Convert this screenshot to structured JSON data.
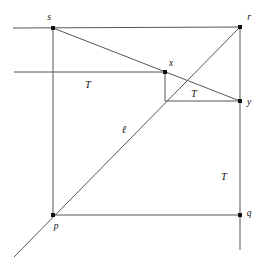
{
  "figure": {
    "background_color": "#ffffff",
    "line_color": "#555555",
    "line_color_dark": "#4a4a4a",
    "vertex_color": "#111111",
    "label_color": "#111111",
    "stroke_width": 1.0,
    "vertex_size": 4
  },
  "points": [
    {
      "id": "s",
      "label": "s",
      "x": 53,
      "y": 28,
      "label_x": 49,
      "label_y": 20
    },
    {
      "id": "r",
      "label": "r",
      "x": 240,
      "y": 27,
      "label_x": 249,
      "label_y": 20
    },
    {
      "id": "x",
      "label": "x",
      "x": 165,
      "y": 72,
      "label_x": 171,
      "label_y": 66
    },
    {
      "id": "y",
      "label": "y",
      "x": 240,
      "y": 101,
      "label_x": 249,
      "label_y": 105
    },
    {
      "id": "p",
      "label": "p",
      "x": 53,
      "y": 215,
      "label_x": 56,
      "label_y": 229
    },
    {
      "id": "q",
      "label": "q",
      "x": 240,
      "y": 215,
      "label_x": 249,
      "label_y": 216
    }
  ],
  "region_labels": [
    {
      "id": "T-left",
      "text": "T",
      "x": 88,
      "y": 88
    },
    {
      "id": "T-inner",
      "text": "T",
      "x": 194,
      "y": 97
    },
    {
      "id": "T-right",
      "text": "T",
      "x": 224,
      "y": 180
    }
  ],
  "line_labels": [
    {
      "id": "ell",
      "text": "ℓ",
      "x": 124,
      "y": 133
    }
  ],
  "segments": [
    {
      "id": "top-edge-s-r",
      "x1": 13,
      "y1": 28,
      "x2": 240,
      "y2": 27
    },
    {
      "id": "left-edge-s-p",
      "x1": 53,
      "y1": 28,
      "x2": 53,
      "y2": 215
    },
    {
      "id": "bottom-edge-p-q",
      "x1": 53,
      "y1": 215,
      "x2": 240,
      "y2": 215
    },
    {
      "id": "right-edge-r-q",
      "x1": 240,
      "y1": 27,
      "x2": 240,
      "y2": 250
    },
    {
      "id": "horizontal-through-x",
      "x1": 14,
      "y1": 72,
      "x2": 165,
      "y2": 72
    },
    {
      "id": "horizontal-x-base-to-y",
      "x1": 165,
      "y1": 101,
      "x2": 240,
      "y2": 101
    },
    {
      "id": "vertical-x-drop",
      "x1": 165,
      "y1": 72,
      "x2": 165,
      "y2": 101
    },
    {
      "id": "diagonal-s-to-y",
      "x1": 53,
      "y1": 28,
      "x2": 240,
      "y2": 101
    },
    {
      "id": "diagonal-ell-p-to-r",
      "x1": 14,
      "y1": 257,
      "x2": 240,
      "y2": 27
    }
  ]
}
